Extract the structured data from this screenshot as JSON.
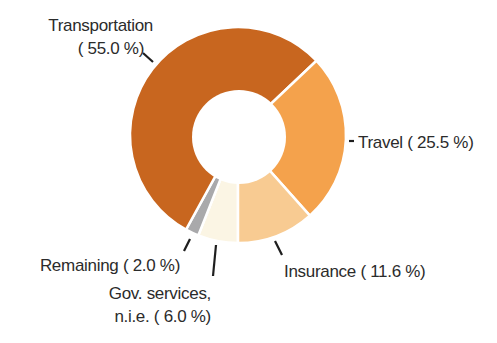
{
  "chart_data": {
    "type": "pie",
    "subtype": "donut",
    "title": "",
    "start_angle_deg": 180,
    "direction": "clockwise",
    "slices": [
      {
        "label": "Gov. services, n.i.e.",
        "value": 6.0,
        "color": "#FBF5E4",
        "display": "Gov. services, n.i.e. ( 6.0 %)"
      },
      {
        "label": "Remaining",
        "value": 2.0,
        "color": "#A9A9AB",
        "display": "Remaining ( 2.0 %)"
      },
      {
        "label": "Transportation",
        "value": 55.0,
        "color": "#C8661F",
        "display": "Transportation ( 55.0 %)"
      },
      {
        "label": "Travel",
        "value": 25.5,
        "color": "#F4A24C",
        "display": "Travel ( 25.5 %)"
      },
      {
        "label": "Insurance",
        "value": 11.6,
        "color": "#F8CB92",
        "display": "Insurance ( 11.6 %)"
      }
    ],
    "categories": [
      "Transportation",
      "Travel",
      "Insurance",
      "Gov. services, n.i.e.",
      "Remaining"
    ],
    "values": [
      55.0,
      25.5,
      11.6,
      6.0,
      2.0
    ],
    "unit": "%",
    "legend": "none (callout labels)"
  },
  "labels": {
    "transportation": {
      "line1": "Transportation",
      "line2": "( 55.0 %)"
    },
    "travel": {
      "line1": "Travel ( 25.5 %)"
    },
    "insurance": {
      "line1": "Insurance ( 11.6 %)"
    },
    "gov_services": {
      "line1": "Gov. services,",
      "line2": "n.i.e. (  6.0 %)"
    },
    "remaining": {
      "line1": "Remaining (  2.0 %)"
    }
  }
}
